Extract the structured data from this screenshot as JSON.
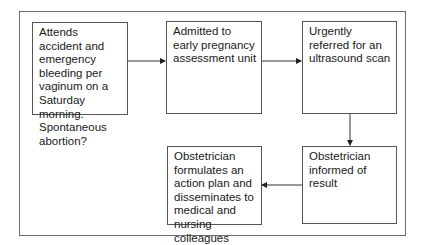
{
  "diagram": {
    "type": "flowchart",
    "nodes": [
      {
        "id": "n1",
        "text": "Attends accident and emergency bleeding per vaginum on a Saturday morning. Spontaneous abortion?"
      },
      {
        "id": "n2",
        "text": "Admitted to early pregnancy assessment unit"
      },
      {
        "id": "n3",
        "text": "Urgently referred for an ultrasound scan"
      },
      {
        "id": "n4",
        "text": "Obstetrician informed of result"
      },
      {
        "id": "n5",
        "text": "Obstetrician formulates an action plan and disseminates to medical and nursing colleagues"
      }
    ],
    "edges": [
      {
        "from": "n1",
        "to": "n2"
      },
      {
        "from": "n2",
        "to": "n3"
      },
      {
        "from": "n3",
        "to": "n4"
      },
      {
        "from": "n4",
        "to": "n5"
      }
    ]
  }
}
